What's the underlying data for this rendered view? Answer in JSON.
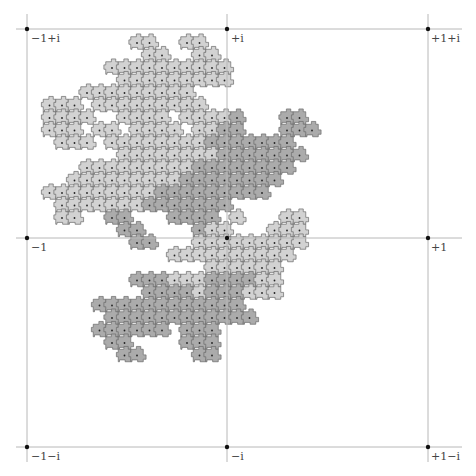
{
  "figure": {
    "grid": {
      "line_color": "#b8b8b8",
      "point_color": "#111111",
      "x_lines_px": [
        27,
        227,
        428
      ],
      "y_lines_px": [
        29,
        238,
        447
      ]
    },
    "labels": [
      {
        "text": "−1+i",
        "x": 31,
        "y": 32
      },
      {
        "text": "+i",
        "x": 231,
        "y": 32
      },
      {
        "text": "+1+i",
        "x": 431,
        "y": 32
      },
      {
        "text": "−1",
        "x": 31,
        "y": 241
      },
      {
        "text": "+1",
        "x": 431,
        "y": 241
      },
      {
        "text": "−1−i",
        "x": 31,
        "y": 450
      },
      {
        "text": "−i",
        "x": 231,
        "y": 450
      },
      {
        "text": "+1−i",
        "x": 431,
        "y": 450
      }
    ],
    "tiles": {
      "cell_px": 12.5,
      "origin_x": -0.5,
      "origin_y": 5.5,
      "colors": {
        "L": "#d2d2d2",
        "D": "#ababab",
        "stroke": "#6a6a6a",
        "dot": "#222222"
      },
      "rows": [
        {
          "j": 3,
          "cells": [
            [
              11,
              12,
              "L"
            ],
            [
              15,
              16,
              "L"
            ]
          ]
        },
        {
          "j": 4,
          "cells": [
            [
              12,
              13,
              "L"
            ],
            [
              16,
              17,
              "L"
            ]
          ]
        },
        {
          "j": 5,
          "cells": [
            [
              9,
              14,
              "L"
            ],
            [
              15,
              18,
              "L"
            ]
          ]
        },
        {
          "j": 6,
          "cells": [
            [
              10,
              18,
              "L"
            ]
          ]
        },
        {
          "j": 7,
          "cells": [
            [
              7,
              15,
              "L"
            ]
          ]
        },
        {
          "j": 8,
          "cells": [
            [
              4,
              6,
              "L"
            ],
            [
              8,
              16,
              "L"
            ]
          ]
        },
        {
          "j": 9,
          "cells": [
            [
              4,
              7,
              "L"
            ],
            [
              10,
              13,
              "L"
            ],
            [
              15,
              18,
              "L"
            ],
            [
              19,
              19,
              "D"
            ],
            [
              23,
              24,
              "D"
            ]
          ]
        },
        {
          "j": 10,
          "cells": [
            [
              4,
              6,
              "L"
            ],
            [
              8,
              9,
              "L"
            ],
            [
              11,
              14,
              "L"
            ],
            [
              16,
              17,
              "L"
            ],
            [
              18,
              19,
              "D"
            ],
            [
              23,
              25,
              "D"
            ]
          ]
        },
        {
          "j": 11,
          "cells": [
            [
              5,
              7,
              "L"
            ],
            [
              9,
              16,
              "L"
            ],
            [
              17,
              18,
              "D"
            ],
            [
              19,
              23,
              "D"
            ]
          ]
        },
        {
          "j": 12,
          "cells": [
            [
              10,
              17,
              "L"
            ],
            [
              18,
              24,
              "D"
            ]
          ]
        },
        {
          "j": 13,
          "cells": [
            [
              7,
              15,
              "L"
            ],
            [
              16,
              18,
              "D"
            ],
            [
              19,
              23,
              "D"
            ]
          ]
        },
        {
          "j": 14,
          "cells": [
            [
              6,
              14,
              "L"
            ],
            [
              15,
              19,
              "D"
            ],
            [
              20,
              22,
              "D"
            ]
          ]
        },
        {
          "j": 15,
          "cells": [
            [
              4,
              12,
              "L"
            ],
            [
              13,
              19,
              "D"
            ],
            [
              20,
              21,
              "D"
            ]
          ]
        },
        {
          "j": 16,
          "cells": [
            [
              5,
              11,
              "L"
            ],
            [
              12,
              18,
              "D"
            ]
          ]
        },
        {
          "j": 17,
          "cells": [
            [
              5,
              6,
              "L"
            ],
            [
              9,
              10,
              "D"
            ],
            [
              14,
              15,
              "D"
            ],
            [
              16,
              17,
              "D"
            ],
            [
              19,
              19,
              "L"
            ],
            [
              23,
              24,
              "L"
            ]
          ]
        },
        {
          "j": 18,
          "cells": [
            [
              10,
              11,
              "D"
            ],
            [
              16,
              16,
              "D"
            ],
            [
              17,
              18,
              "L"
            ],
            [
              22,
              24,
              "L"
            ]
          ]
        },
        {
          "j": 19,
          "cells": [
            [
              11,
              12,
              "D"
            ],
            [
              16,
              18,
              "L"
            ],
            [
              19,
              22,
              "L"
            ],
            [
              23,
              24,
              "L"
            ]
          ]
        },
        {
          "j": 20,
          "cells": [
            [
              14,
              16,
              "L"
            ],
            [
              17,
              23,
              "L"
            ]
          ]
        },
        {
          "j": 21,
          "cells": [
            [
              17,
              17,
              "L"
            ],
            [
              18,
              21,
              "L"
            ],
            [
              22,
              22,
              "L"
            ]
          ]
        },
        {
          "j": 22,
          "cells": [
            [
              11,
              13,
              "D"
            ],
            [
              14,
              16,
              "L"
            ],
            [
              17,
              18,
              "D"
            ],
            [
              19,
              20,
              "D"
            ],
            [
              21,
              22,
              "L"
            ]
          ]
        },
        {
          "j": 23,
          "cells": [
            [
              12,
              15,
              "D"
            ],
            [
              16,
              16,
              "L"
            ],
            [
              17,
              19,
              "D"
            ],
            [
              20,
              22,
              "L"
            ]
          ]
        },
        {
          "j": 24,
          "cells": [
            [
              8,
              19,
              "D"
            ]
          ]
        },
        {
          "j": 25,
          "cells": [
            [
              9,
              20,
              "D"
            ]
          ]
        },
        {
          "j": 26,
          "cells": [
            [
              8,
              9,
              "D"
            ],
            [
              10,
              13,
              "D"
            ],
            [
              15,
              17,
              "D"
            ]
          ]
        },
        {
          "j": 27,
          "cells": [
            [
              9,
              10,
              "D"
            ],
            [
              15,
              17,
              "D"
            ]
          ]
        },
        {
          "j": 28,
          "cells": [
            [
              10,
              11,
              "D"
            ],
            [
              16,
              17,
              "D"
            ]
          ]
        }
      ]
    }
  }
}
